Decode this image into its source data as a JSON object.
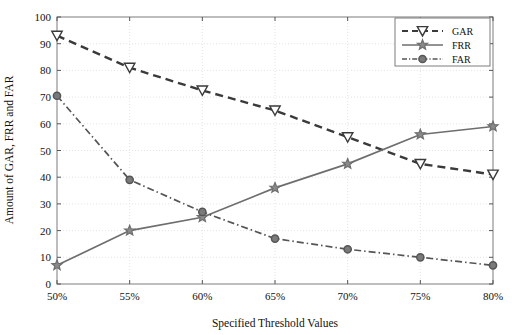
{
  "chart_data": {
    "type": "line",
    "title": "",
    "xlabel": "Specified Threshold Values",
    "ylabel": "Amount of GAR, FRR and FAR",
    "categories": [
      "50%",
      "55%",
      "60%",
      "65%",
      "70%",
      "75%",
      "80%"
    ],
    "x": [
      50,
      55,
      60,
      65,
      70,
      75,
      80
    ],
    "xlim": [
      50,
      80
    ],
    "ylim": [
      0,
      100
    ],
    "ytick_labels": [
      "0",
      "10",
      "20",
      "30",
      "40",
      "50",
      "60",
      "70",
      "80",
      "90",
      "100"
    ],
    "yticks": [
      0,
      10,
      20,
      30,
      40,
      50,
      60,
      70,
      80,
      90,
      100
    ],
    "grid": true,
    "legend_position": "top-right",
    "series": [
      {
        "name": "GAR",
        "values": [
          93,
          81,
          72.5,
          65,
          55,
          45,
          41
        ],
        "line_style": "dashed",
        "marker": "triangle-down",
        "color": "#3a3a3a"
      },
      {
        "name": "FRR",
        "values": [
          7,
          20,
          25,
          36,
          45,
          56,
          59
        ],
        "line_style": "solid",
        "marker": "pentagram",
        "color": "#6e6e6e"
      },
      {
        "name": "FAR",
        "values": [
          70.5,
          39,
          27,
          17,
          13,
          10,
          7
        ],
        "line_style": "dashdot",
        "marker": "circle",
        "color": "#555555"
      }
    ]
  },
  "legend": {
    "entries": [
      {
        "label": "GAR"
      },
      {
        "label": "FRR"
      },
      {
        "label": "FAR"
      }
    ]
  }
}
